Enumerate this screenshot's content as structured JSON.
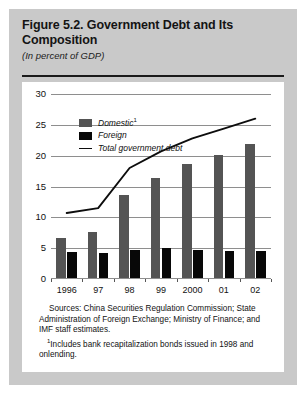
{
  "figure": {
    "title": "Figure 5.2. Government Debt and Its Composition",
    "subtitle": "(In percent of GDP)",
    "sources": "Sources: China Securities Regulation Commission; State Administration of Foreign Exchange; Ministry of Finance; and IMF staff estimates.",
    "footnote_marker": "1",
    "footnote": "Includes bank recapitalization bonds issued in 1998 and onlending."
  },
  "colors": {
    "figure_background": "#c9c9c9",
    "panel_background": "#ffffff",
    "domestic": "#545454",
    "foreign": "#080808",
    "total_line": "#0d0d0d",
    "gridline": "#8e8e8e"
  },
  "chart_data": {
    "type": "bar",
    "title": "Figure 5.2. Government Debt and Its Composition",
    "subtitle": "(In percent of GDP)",
    "xlabel": "",
    "ylabel": "",
    "ylim": [
      0,
      30
    ],
    "yticks": [
      0,
      5,
      10,
      15,
      20,
      25,
      30
    ],
    "ytick_labels": [
      "0",
      "5",
      "10",
      "15",
      "20",
      "25",
      "30"
    ],
    "grid": true,
    "legend_position": "upper left",
    "categories": [
      "1996",
      "97",
      "98",
      "99",
      "2000",
      "01",
      "02"
    ],
    "series": [
      {
        "name": "Domestic",
        "name_full": "Domestic",
        "footnote_marker": "1",
        "type": "bar",
        "color": "#545454",
        "values": [
          6.5,
          7.4,
          13.5,
          16.2,
          18.5,
          20.0,
          21.7
        ]
      },
      {
        "name": "Foreign",
        "name_full": "Foreign",
        "type": "bar",
        "color": "#080808",
        "values": [
          4.2,
          4.1,
          4.5,
          4.9,
          4.6,
          4.4,
          4.3
        ]
      },
      {
        "name": "Total government debt",
        "name_full": "Total government debt",
        "type": "line",
        "color": "#0d0d0d",
        "values": [
          10.7,
          11.5,
          18.0,
          20.7,
          22.8,
          24.4,
          26.0
        ]
      }
    ]
  }
}
